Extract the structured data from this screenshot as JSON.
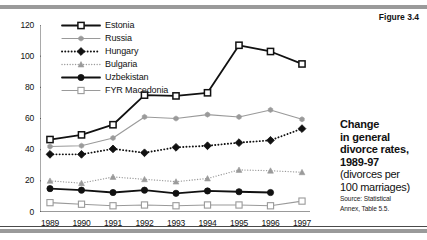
{
  "figure_label": "Figure 3.4",
  "caption": {
    "line1": "Change",
    "line2": "in general",
    "line3": "divorce rates,",
    "line4": "1989-97",
    "line5": "(divorces per",
    "line6": "100 marriages)",
    "source1": "Source: Statistical",
    "source2": "Annex, Table 5.5."
  },
  "colors": {
    "dark": "#111111",
    "gray": "#9a9a9a",
    "rule": "#9a9a9a",
    "background": "#ffffff"
  },
  "chart_data": {
    "type": "line",
    "title": "Change in general divorce rates, 1989-97",
    "subtitle": "(divorces per 100 marriages)",
    "xlabel": "",
    "ylabel": "",
    "ylim": [
      0,
      120
    ],
    "yticks": [
      0,
      20,
      40,
      60,
      80,
      100,
      120
    ],
    "grid": false,
    "legend_position": "top-left",
    "categories": [
      "1989",
      "1990",
      "1991",
      "1992",
      "1993",
      "1994",
      "1995",
      "1996",
      "1997"
    ],
    "series": [
      {
        "name": "Estonia",
        "marker": "open-square",
        "line": "solid",
        "color": "#111111",
        "values": [
          46.5,
          49.5,
          56,
          75,
          74.5,
          76.5,
          107,
          103,
          95
        ]
      },
      {
        "name": "Russia",
        "marker": "small-star",
        "line": "solid",
        "color": "#9a9a9a",
        "values": [
          42,
          42.5,
          47.5,
          61,
          60,
          62.5,
          61,
          65.5,
          59.5
        ]
      },
      {
        "name": "Hungary",
        "marker": "filled-diamond",
        "line": "dotted",
        "color": "#111111",
        "values": [
          37,
          37,
          40.5,
          38,
          41.5,
          42.5,
          44.5,
          46,
          53.5
        ]
      },
      {
        "name": "Bulgaria",
        "marker": "small-triangle",
        "line": "dotted",
        "color": "#9a9a9a",
        "values": [
          20,
          18.5,
          22.5,
          21,
          19.5,
          21.5,
          27,
          26.5,
          25.5
        ]
      },
      {
        "name": "Uzbekistan",
        "marker": "filled-circle",
        "line": "solid",
        "color": "#111111",
        "values": [
          15,
          14,
          12.5,
          14,
          12,
          13.5,
          13,
          12.5,
          null
        ]
      },
      {
        "name": "FYR Macedonia",
        "marker": "open-square",
        "line": "solid",
        "color": "#9a9a9a",
        "values": [
          6,
          5,
          4,
          4.5,
          4,
          4.5,
          4.5,
          4,
          7
        ]
      }
    ]
  }
}
